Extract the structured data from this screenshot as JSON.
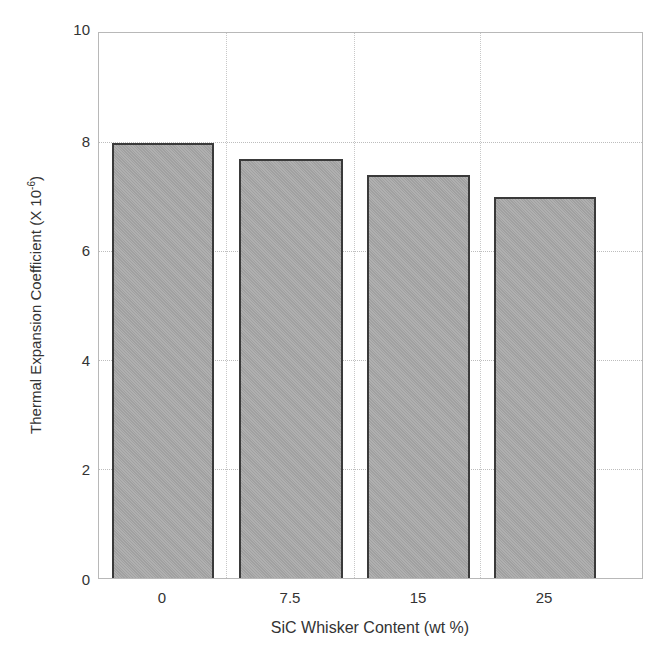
{
  "chart_data": {
    "type": "bar",
    "title": "",
    "xlabel": "SiC Whisker Content (wt %)",
    "ylabel_main": "Thermal Expansion Coefficient (X 10",
    "ylabel_sup": "-6",
    "ylabel_close": ")",
    "categories": [
      "0",
      "7.5",
      "15",
      "25"
    ],
    "values": [
      8.0,
      7.7,
      7.4,
      7.0
    ],
    "ylim": [
      0,
      10
    ],
    "yticks": [
      "0",
      "2",
      "4",
      "6",
      "8",
      "10"
    ],
    "grid": true,
    "legend": null,
    "colors": {
      "bar_fill": "#a9a9a9",
      "bar_edge": "#3a3a3a",
      "grid": "#bdbdbd",
      "frame": "#b8b8b8"
    }
  }
}
